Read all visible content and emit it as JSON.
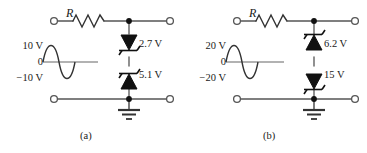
{
  "figure": {
    "type": "electronic-circuit-schematic",
    "background_color": "#ffffff",
    "wire_color": "#555555",
    "symbol_color": "#111111"
  },
  "circuits": [
    {
      "id": "a",
      "caption": "(a)",
      "resistor_label": "R",
      "source": {
        "type": "sine-wave-ac-source",
        "peak_positive_label": "10 V",
        "zero_label": "0",
        "peak_negative_label": "−10 V"
      },
      "diodes": [
        {
          "position": "top",
          "type": "zener-diode",
          "orientation": "cathode-down",
          "label": "2.7 V"
        },
        {
          "position": "bottom",
          "type": "zener-diode",
          "orientation": "cathode-up",
          "label": "5.1 V"
        }
      ],
      "ground": "earth-ground",
      "terminals": [
        "input-top-left",
        "output-top-right",
        "input-bottom-left",
        "output-bottom-right"
      ]
    },
    {
      "id": "b",
      "caption": "(b)",
      "resistor_label": "R",
      "source": {
        "type": "sine-wave-ac-source",
        "peak_positive_label": "20 V",
        "zero_label": "0",
        "peak_negative_label": "−20 V"
      },
      "diodes": [
        {
          "position": "top",
          "type": "zener-diode",
          "orientation": "cathode-up",
          "label": "6.2 V"
        },
        {
          "position": "bottom",
          "type": "zener-diode",
          "orientation": "cathode-down",
          "label": "15 V"
        }
      ],
      "ground": "earth-ground",
      "terminals": [
        "input-top-left",
        "output-top-right",
        "input-bottom-left",
        "output-bottom-right"
      ]
    }
  ]
}
